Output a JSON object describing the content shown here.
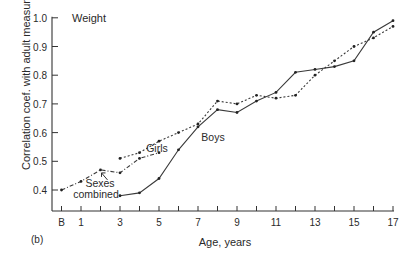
{
  "figure": {
    "panel_label": "(b)",
    "inner_title": "Weight"
  },
  "chart_data": {
    "type": "line",
    "title": "Weight",
    "panel": "(b)",
    "xlabel": "Age, years",
    "ylabel": "Correlation coef. with adult measurement",
    "xlim": [
      0,
      17
    ],
    "ylim": [
      0.4,
      1.0
    ],
    "x_ticks": [
      0,
      1,
      2,
      3,
      4,
      5,
      6,
      7,
      8,
      9,
      10,
      11,
      12,
      13,
      14,
      15,
      16,
      17
    ],
    "x_tick_labels": [
      {
        "x": 0,
        "label": "B"
      },
      {
        "x": 1,
        "label": "1"
      },
      {
        "x": 3,
        "label": "3"
      },
      {
        "x": 5,
        "label": "5"
      },
      {
        "x": 7,
        "label": "7"
      },
      {
        "x": 9,
        "label": "9"
      },
      {
        "x": 11,
        "label": "11"
      },
      {
        "x": 13,
        "label": "13"
      },
      {
        "x": 15,
        "label": "15"
      },
      {
        "x": 17,
        "label": "17"
      }
    ],
    "y_ticks": [
      0.4,
      0.5,
      0.6,
      0.7,
      0.8,
      0.9,
      1.0
    ],
    "y_tick_labels": [
      "0.4",
      "0.5",
      "0.6",
      "0.7",
      "0.8",
      "0.9",
      "1.0"
    ],
    "grid": false,
    "legend": "inline labels",
    "series": [
      {
        "name": "Sexes combined",
        "style": "dash-dot",
        "x": [
          0,
          1,
          2,
          3,
          4,
          5
        ],
        "values": [
          0.4,
          0.43,
          0.47,
          0.46,
          0.51,
          0.53
        ]
      },
      {
        "name": "Girls",
        "style": "dotted",
        "x": [
          3,
          4,
          5,
          6,
          7,
          8,
          9,
          10,
          11,
          12,
          13,
          14,
          15,
          16,
          17
        ],
        "values": [
          0.51,
          0.53,
          0.57,
          0.6,
          0.63,
          0.71,
          0.7,
          0.73,
          0.72,
          0.73,
          0.8,
          0.85,
          0.9,
          0.93,
          0.97
        ]
      },
      {
        "name": "Boys",
        "style": "solid",
        "x": [
          3,
          4,
          5,
          6,
          7,
          8,
          9,
          10,
          11,
          12,
          13,
          14,
          15,
          16,
          17
        ],
        "values": [
          0.38,
          0.39,
          0.44,
          0.54,
          0.62,
          0.68,
          0.67,
          0.71,
          0.74,
          0.81,
          0.82,
          0.83,
          0.85,
          0.95,
          0.99
        ]
      }
    ],
    "annotations": [
      {
        "text": "Girls",
        "x": 4.6,
        "y": 0.585
      },
      {
        "text": "Boys",
        "x": 7.6,
        "y": 0.56
      },
      {
        "text": "Sexes combined",
        "x": 1.9,
        "y": 0.4,
        "arrow_to": {
          "x": 2,
          "y": 0.47
        }
      }
    ]
  }
}
